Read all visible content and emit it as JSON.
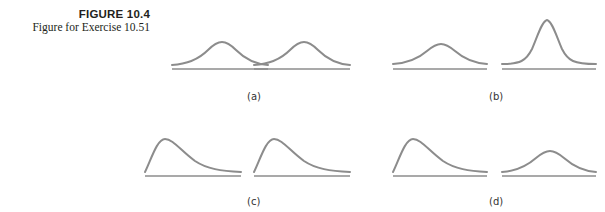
{
  "caption": {
    "figure_number": "FIGURE 10.4",
    "title": "Figure for Exercise 10.51"
  },
  "colors": {
    "curve": "#8c8c8c",
    "text": "#231f20"
  },
  "panels": [
    {
      "label": "(a)",
      "left": "symmetric bell (moderate spread)",
      "right": "symmetric bell (moderate spread)"
    },
    {
      "label": "(b)",
      "left": "symmetric bell (wide spread)",
      "right": "symmetric bell (narrow, tall)"
    },
    {
      "label": "(c)",
      "left": "right-skewed",
      "right": "right-skewed"
    },
    {
      "label": "(d)",
      "left": "right-skewed",
      "right": "symmetric bell"
    }
  ]
}
